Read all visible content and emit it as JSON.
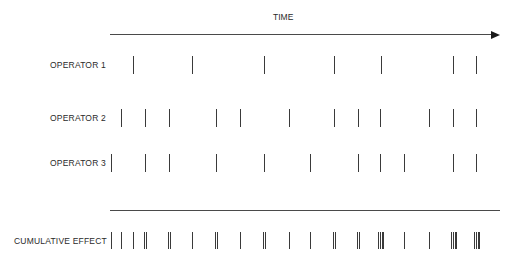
{
  "diagram": {
    "axis": {
      "title": "TIME",
      "x_start": 110,
      "x_end": 500,
      "y": 34
    },
    "operators": [
      {
        "label": "OPERATOR 1",
        "y": 57,
        "ticks": [
          133,
          192,
          264,
          334,
          381,
          453,
          476
        ]
      },
      {
        "label": "OPERATOR 2",
        "y": 108,
        "ticks": [
          121,
          145,
          169,
          216,
          240,
          289,
          334,
          358,
          380,
          429,
          453,
          476
        ]
      },
      {
        "label": "OPERATOR 3",
        "y": 153,
        "ticks": [
          111,
          145,
          169,
          216,
          264,
          310,
          358,
          380,
          404,
          453,
          476
        ]
      }
    ],
    "divider": {
      "x_start": 110,
      "x_end": 500,
      "y": 210
    },
    "cumulative": {
      "label": "CUMULATIVE EFFECT",
      "y": 232,
      "marks": [
        {
          "x": 111,
          "count": 1
        },
        {
          "x": 121,
          "count": 1
        },
        {
          "x": 133,
          "count": 1
        },
        {
          "x": 145,
          "count": 2
        },
        {
          "x": 169,
          "count": 2
        },
        {
          "x": 192,
          "count": 1
        },
        {
          "x": 216,
          "count": 2
        },
        {
          "x": 240,
          "count": 1
        },
        {
          "x": 264,
          "count": 2
        },
        {
          "x": 289,
          "count": 1
        },
        {
          "x": 310,
          "count": 1
        },
        {
          "x": 334,
          "count": 2
        },
        {
          "x": 358,
          "count": 2
        },
        {
          "x": 380,
          "count": 3
        },
        {
          "x": 404,
          "count": 1
        },
        {
          "x": 429,
          "count": 1
        },
        {
          "x": 453,
          "count": 3
        },
        {
          "x": 476,
          "count": 3
        }
      ]
    }
  }
}
